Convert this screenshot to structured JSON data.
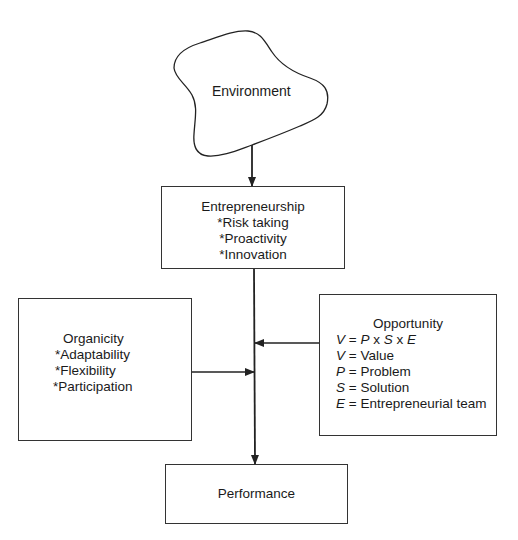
{
  "environment": {
    "label": "Environment"
  },
  "entrepreneurship": {
    "title": "Entrepreneurship",
    "items": [
      "*Risk taking",
      "*Proactivity",
      "*Innovation"
    ]
  },
  "organicity": {
    "title": "Organicity",
    "items": [
      "*Adaptability",
      "*Flexibility",
      "*Participation"
    ]
  },
  "opportunity": {
    "title": "Opportunity",
    "formula": {
      "v": "V",
      "eq": " = ",
      "p": "P",
      "x1": " x ",
      "s": "S",
      "x2": " x ",
      "e": "E"
    },
    "definitions": [
      {
        "sym": "V",
        "text": " = Value"
      },
      {
        "sym": "P",
        "text": " = Problem"
      },
      {
        "sym": "S",
        "text": " = Solution"
      },
      {
        "sym": "E",
        "text": " = Entrepreneurial team"
      }
    ]
  },
  "performance": {
    "label": "Performance"
  },
  "colors": {
    "stroke": "#333333",
    "text": "#1a1a1a",
    "background": "#ffffff"
  }
}
